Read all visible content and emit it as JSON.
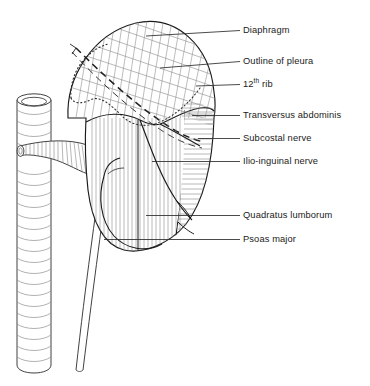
{
  "figure": {
    "background_color": "#ffffff",
    "outline_color": "#1a1a1a",
    "hatch_color": "#8a8a8a",
    "leader_color": "#2b2b2b",
    "text_color": "#1a1a1a"
  },
  "labels": [
    {
      "id": "diaphragm",
      "text": "Diaphragm",
      "text_x": 243,
      "text_y": 27,
      "leader": {
        "x1": 226,
        "y1": 30.5,
        "x2": 240,
        "y2": 30.5
      },
      "pointer": {
        "x1": 146,
        "y1": 36,
        "x2": 226,
        "y2": 30.5
      }
    },
    {
      "id": "outline-of-pleura",
      "text": "Outline of pleura",
      "text_x": 243,
      "text_y": 58,
      "leader": {
        "x1": 226,
        "y1": 61.5,
        "x2": 240,
        "y2": 61.5
      },
      "pointer": {
        "x1": 160,
        "y1": 68,
        "x2": 226,
        "y2": 61.5
      }
    },
    {
      "id": "twelfth-rib",
      "text": "12",
      "superscript": "th",
      "text_suffix": " rib",
      "text_x": 243,
      "text_y": 81,
      "leader": {
        "x1": 226,
        "y1": 84.5,
        "x2": 240,
        "y2": 84.5
      },
      "pointer": {
        "x1": 168,
        "y1": 90,
        "x2": 226,
        "y2": 84.5
      }
    },
    {
      "id": "transversus-abdominis",
      "text": "Transversus abdominis",
      "text_x": 243,
      "text_y": 112,
      "leader": {
        "x1": 226,
        "y1": 115.5,
        "x2": 240,
        "y2": 115.5
      },
      "pointer": {
        "x1": 192,
        "y1": 115.5,
        "x2": 226,
        "y2": 115.5
      }
    },
    {
      "id": "subcostal-nerve",
      "text": "Subcostal nerve",
      "text_x": 243,
      "text_y": 135,
      "leader": {
        "x1": 226,
        "y1": 138.5,
        "x2": 240,
        "y2": 138.5
      },
      "pointer": {
        "x1": 198,
        "y1": 138.5,
        "x2": 226,
        "y2": 138.5
      }
    },
    {
      "id": "ilio-inguinal-nerve",
      "text": "Ilio-inguinal nerve",
      "text_x": 243,
      "text_y": 158,
      "leader": {
        "x1": 226,
        "y1": 161.5,
        "x2": 240,
        "y2": 161.5
      },
      "pointer": {
        "x1": 152,
        "y1": 161.5,
        "x2": 226,
        "y2": 161.5
      }
    },
    {
      "id": "quadratus-lumborum",
      "text": "Quadratus lumborum",
      "text_x": 243,
      "text_y": 212,
      "leader": {
        "x1": 226,
        "y1": 215.5,
        "x2": 240,
        "y2": 215.5
      },
      "pointer": {
        "x1": 146,
        "y1": 215.5,
        "x2": 226,
        "y2": 215.5
      }
    },
    {
      "id": "psoas-major",
      "text": "Psoas major",
      "text_x": 243,
      "text_y": 236,
      "leader": {
        "x1": 226,
        "y1": 239.5,
        "x2": 240,
        "y2": 239.5
      },
      "pointer": {
        "x1": 104,
        "y1": 239.5,
        "x2": 226,
        "y2": 239.5
      }
    }
  ],
  "structures": [
    {
      "id": "vertebral-column",
      "name": "vertebral column / great vessel",
      "type": "cylinder",
      "x": 16,
      "y_top": 92,
      "y_bottom": 372,
      "width": 36
    },
    {
      "id": "renal-vessel",
      "name": "renal vessel crossing",
      "type": "tube"
    },
    {
      "id": "ureter",
      "name": "ureter",
      "type": "thin-tube",
      "x": 72,
      "y_bottom": 370
    },
    {
      "id": "kidney-outline",
      "name": "kidney and muscle field outline",
      "type": "closed-curve"
    },
    {
      "id": "diaphragm-region",
      "name": "diaphragm cross-hatched region",
      "type": "cross-hatch"
    },
    {
      "id": "pleura-outline",
      "name": "pleura dotted outline",
      "type": "dotted-curve"
    },
    {
      "id": "rib-12",
      "name": "12th rib dashed band",
      "type": "dashed-band"
    },
    {
      "id": "psoas-region",
      "name": "psoas major vertical hatch",
      "type": "vertical-hatch"
    },
    {
      "id": "quadratus-region",
      "name": "quadratus lumborum horizontal hatch",
      "type": "horizontal-hatch"
    },
    {
      "id": "transversus-region",
      "name": "transversus abdominis horizontal hatch",
      "type": "horizontal-hatch"
    },
    {
      "id": "subcostal-nerve-line",
      "name": "subcostal nerve",
      "type": "curve"
    },
    {
      "id": "ilio-inguinal-nerve-line",
      "name": "ilio-inguinal nerve",
      "type": "curve"
    }
  ]
}
